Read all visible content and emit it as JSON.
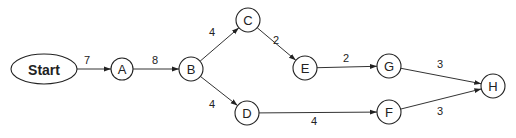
{
  "diagram": {
    "type": "network-graph",
    "nodes": [
      {
        "id": "Start",
        "label": "Start",
        "shape": "ellipse",
        "x": 44,
        "y": 69,
        "rx": 33,
        "ry": 15
      },
      {
        "id": "A",
        "label": "A",
        "shape": "circle",
        "x": 122,
        "y": 69,
        "r": 11
      },
      {
        "id": "B",
        "label": "B",
        "shape": "circle",
        "x": 191,
        "y": 69,
        "r": 12
      },
      {
        "id": "C",
        "label": "C",
        "shape": "circle",
        "x": 248,
        "y": 20,
        "r": 12
      },
      {
        "id": "D",
        "label": "D",
        "shape": "circle",
        "x": 247,
        "y": 113,
        "r": 12
      },
      {
        "id": "E",
        "label": "E",
        "shape": "circle",
        "x": 305,
        "y": 68,
        "r": 12
      },
      {
        "id": "G",
        "label": "G",
        "shape": "circle",
        "x": 389,
        "y": 66,
        "r": 12
      },
      {
        "id": "F",
        "label": "F",
        "shape": "circle",
        "x": 389,
        "y": 112,
        "r": 12
      },
      {
        "id": "H",
        "label": "H",
        "shape": "circle",
        "x": 493,
        "y": 86,
        "r": 12
      }
    ],
    "edges": [
      {
        "from": "Start",
        "to": "A",
        "weight": "7",
        "lx": 87,
        "ly": 60
      },
      {
        "from": "A",
        "to": "B",
        "weight": "8",
        "lx": 155,
        "ly": 60
      },
      {
        "from": "B",
        "to": "C",
        "weight": "4",
        "lx": 212,
        "ly": 32
      },
      {
        "from": "B",
        "to": "D",
        "weight": "4",
        "lx": 212,
        "ly": 104
      },
      {
        "from": "C",
        "to": "E",
        "weight": "2",
        "lx": 276,
        "ly": 40
      },
      {
        "from": "E",
        "to": "G",
        "weight": "2",
        "lx": 346,
        "ly": 58
      },
      {
        "from": "D",
        "to": "F",
        "weight": "4",
        "lx": 314,
        "ly": 121
      },
      {
        "from": "G",
        "to": "H",
        "weight": "3",
        "lx": 440,
        "ly": 64
      },
      {
        "from": "F",
        "to": "H",
        "weight": "3",
        "lx": 440,
        "ly": 111
      }
    ]
  }
}
